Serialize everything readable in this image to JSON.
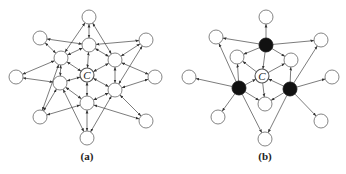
{
  "figure": {
    "panels": [
      {
        "id": "a",
        "caption": "(a)",
        "center_label": "C",
        "node_radius": 7,
        "nodes": [
          {
            "id": "top",
            "x": 89,
            "y": 17,
            "fill": "white"
          },
          {
            "id": "ul",
            "x": 40,
            "y": 38,
            "fill": "white"
          },
          {
            "id": "ur",
            "x": 146,
            "y": 40,
            "fill": "white"
          },
          {
            "id": "it",
            "x": 89,
            "y": 45,
            "fill": "white"
          },
          {
            "id": "iul",
            "x": 61,
            "y": 58,
            "fill": "white"
          },
          {
            "id": "iur",
            "x": 115,
            "y": 60,
            "fill": "white"
          },
          {
            "id": "l",
            "x": 16,
            "y": 77,
            "fill": "white"
          },
          {
            "id": "r",
            "x": 155,
            "y": 77,
            "fill": "white"
          },
          {
            "id": "c",
            "x": 87,
            "y": 75,
            "fill": "center"
          },
          {
            "id": "ill",
            "x": 60,
            "y": 83,
            "fill": "white"
          },
          {
            "id": "ilr",
            "x": 115,
            "y": 90,
            "fill": "white"
          },
          {
            "id": "ib",
            "x": 87,
            "y": 103,
            "fill": "white"
          },
          {
            "id": "ll",
            "x": 40,
            "y": 117,
            "fill": "white"
          },
          {
            "id": "lr",
            "x": 146,
            "y": 121,
            "fill": "white"
          },
          {
            "id": "bot",
            "x": 87,
            "y": 138,
            "fill": "white"
          }
        ],
        "edges": [
          [
            "top",
            "it"
          ],
          [
            "top",
            "iul"
          ],
          [
            "top",
            "iur"
          ],
          [
            "ul",
            "it"
          ],
          [
            "ul",
            "iul"
          ],
          [
            "ur",
            "it"
          ],
          [
            "ur",
            "iur"
          ],
          [
            "ur",
            "ilr"
          ],
          [
            "it",
            "iul"
          ],
          [
            "it",
            "iur"
          ],
          [
            "it",
            "c"
          ],
          [
            "iul",
            "c"
          ],
          [
            "iul",
            "ill"
          ],
          [
            "iul",
            "l"
          ],
          [
            "iul",
            "ll"
          ],
          [
            "iur",
            "c"
          ],
          [
            "iur",
            "ilr"
          ],
          [
            "iur",
            "r"
          ],
          [
            "l",
            "ill"
          ],
          [
            "r",
            "ilr"
          ],
          [
            "c",
            "ill"
          ],
          [
            "c",
            "ilr"
          ],
          [
            "c",
            "ib"
          ],
          [
            "ill",
            "ib"
          ],
          [
            "ill",
            "ll"
          ],
          [
            "ill",
            "bot"
          ],
          [
            "ilr",
            "ib"
          ],
          [
            "ilr",
            "lr"
          ],
          [
            "ilr",
            "bot"
          ],
          [
            "ib",
            "ll"
          ],
          [
            "ib",
            "lr"
          ],
          [
            "ib",
            "bot"
          ]
        ]
      },
      {
        "id": "b",
        "caption": "(b)",
        "center_label": "C",
        "node_radius": 7,
        "nodes": [
          {
            "id": "top",
            "x": 266,
            "y": 17,
            "fill": "white"
          },
          {
            "id": "ul",
            "x": 216,
            "y": 37,
            "fill": "white"
          },
          {
            "id": "ur",
            "x": 321,
            "y": 40,
            "fill": "white"
          },
          {
            "id": "bt",
            "x": 266,
            "y": 45,
            "fill": "black"
          },
          {
            "id": "iul",
            "x": 237,
            "y": 57,
            "fill": "white"
          },
          {
            "id": "iur",
            "x": 291,
            "y": 60,
            "fill": "white"
          },
          {
            "id": "l",
            "x": 189,
            "y": 77,
            "fill": "white"
          },
          {
            "id": "r",
            "x": 332,
            "y": 77,
            "fill": "white"
          },
          {
            "id": "c",
            "x": 262,
            "y": 76,
            "fill": "center"
          },
          {
            "id": "bl",
            "x": 239,
            "y": 88,
            "fill": "black"
          },
          {
            "id": "br",
            "x": 290,
            "y": 89,
            "fill": "black"
          },
          {
            "id": "ib",
            "x": 265,
            "y": 104,
            "fill": "white"
          },
          {
            "id": "ll",
            "x": 218,
            "y": 117,
            "fill": "white"
          },
          {
            "id": "lr",
            "x": 321,
            "y": 121,
            "fill": "white"
          },
          {
            "id": "bot",
            "x": 265,
            "y": 139,
            "fill": "white"
          }
        ],
        "edges": [
          [
            "bt",
            "top"
          ],
          [
            "bt",
            "ul"
          ],
          [
            "bt",
            "ur"
          ],
          [
            "bt",
            "iul"
          ],
          [
            "bt",
            "iur"
          ],
          [
            "bt",
            "c"
          ],
          [
            "bl",
            "ul"
          ],
          [
            "bl",
            "l"
          ],
          [
            "bl",
            "ll"
          ],
          [
            "bl",
            "iul"
          ],
          [
            "bl",
            "c"
          ],
          [
            "bl",
            "ib"
          ],
          [
            "bl",
            "bot"
          ],
          [
            "br",
            "ur"
          ],
          [
            "br",
            "r"
          ],
          [
            "br",
            "lr"
          ],
          [
            "br",
            "iur"
          ],
          [
            "br",
            "c"
          ],
          [
            "br",
            "ib"
          ],
          [
            "br",
            "bot"
          ],
          [
            "c",
            "iul"
          ],
          [
            "c",
            "iur"
          ],
          [
            "c",
            "ib"
          ]
        ]
      }
    ]
  }
}
